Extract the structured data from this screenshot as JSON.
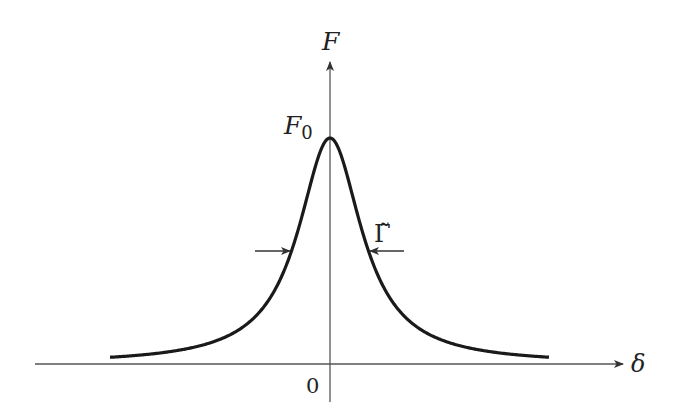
{
  "diagram": {
    "type": "lorentzian-line-profile",
    "y_axis_label": "F",
    "x_axis_label": "δ",
    "peak_label": "F",
    "peak_label_subscript": "0",
    "origin_label": "0",
    "width_label": "Γ̃",
    "colors": {
      "ink": "#222222",
      "background": "#ffffff"
    }
  },
  "chart_data": {
    "type": "line",
    "title": "",
    "xlabel": "δ",
    "ylabel": "F",
    "function": "Lorentzian F(δ) = F0 / (1 + (2δ/Γ̃)^2)",
    "peak": {
      "x": 0,
      "y": "F0"
    },
    "annotations": [
      "F0 at peak",
      "Γ̃ = full width at half maximum",
      "0 at origin"
    ],
    "grid": false,
    "legend": null
  }
}
